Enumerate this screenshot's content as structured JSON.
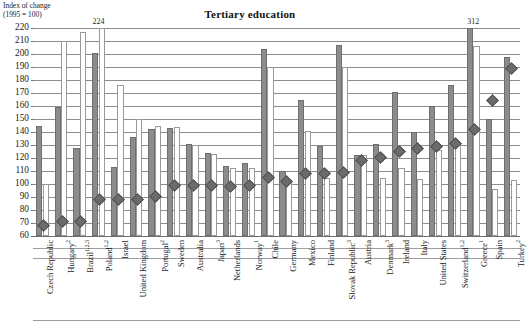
{
  "chart_data": {
    "type": "bar",
    "title": "Tertiary education",
    "ylabel": "Index of change\n(1995 = 100)",
    "axis_caption_line1": "Index of change",
    "axis_caption_line2": "(1995 = 100)",
    "xlabel": "",
    "ylim": [
      60,
      220
    ],
    "ytick_step": 10,
    "yticks": [
      220,
      210,
      200,
      190,
      180,
      170,
      160,
      150,
      140,
      130,
      120,
      110,
      100,
      90,
      80,
      70,
      60
    ],
    "grid": true,
    "legend_position": "none",
    "baseline": 100,
    "categories": [
      "Czech Republic",
      "Hungary",
      "Brazil",
      "Poland",
      "Israel",
      "United Kingdom",
      "Portugal",
      "Sweden",
      "Australia",
      "Japan",
      "Netherlands",
      "Norway",
      "Chile",
      "Germany",
      "Mexico",
      "Finland",
      "Slovak Republic",
      "Austria",
      "Denmark",
      "Ireland",
      "Italy",
      "United States",
      "Switzerland",
      "Greece",
      "Spain",
      "Turkey"
    ],
    "category_footnotes": [
      "",
      "2",
      "1,2,3",
      "1,2",
      "",
      "",
      "2",
      "",
      "",
      "3",
      "",
      "1",
      "",
      "",
      "",
      "",
      "3",
      "",
      "3",
      "",
      "",
      "",
      "1,2",
      "1",
      "",
      "2"
    ],
    "series": [
      {
        "name": "series-dark",
        "style": "dark-filled",
        "color": "#8c8c8c",
        "values": [
          145,
          159,
          128,
          201,
          113,
          136,
          142,
          143,
          131,
          124,
          114,
          116,
          204,
          110,
          165,
          129,
          207,
          122,
          131,
          171,
          140,
          160,
          176,
          312,
          150,
          198
        ]
      },
      {
        "name": "series-light",
        "style": "white-outlined",
        "color": "#ffffff",
        "values": [
          100,
          210,
          217,
          224,
          176,
          150,
          145,
          144,
          130,
          123,
          112,
          112,
          190,
          102,
          141,
          105,
          190,
          122,
          105,
          112,
          104,
          126,
          131,
          206,
          96,
          103
        ]
      }
    ],
    "markers": {
      "name": "diamond-marker",
      "style": "diamond",
      "color": "#6b6b6b",
      "values": [
        69,
        72,
        72,
        89,
        89,
        89,
        91,
        100,
        100,
        100,
        99,
        100,
        106,
        103,
        109,
        109,
        110,
        119,
        121,
        126,
        128,
        130,
        132,
        143,
        165,
        190
      ]
    },
    "value_labels": [
      {
        "category": "Poland",
        "value": "224",
        "series": "series-light"
      },
      {
        "category": "Greece",
        "value": "312",
        "series": "series-dark"
      }
    ]
  }
}
